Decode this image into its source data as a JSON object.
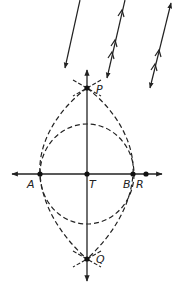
{
  "diagram": {
    "type": "geometric-construction",
    "colors": {
      "stroke": "#222222",
      "background": "#ffffff"
    },
    "points": {
      "P": {
        "label": "P",
        "x": 87,
        "y": 88
      },
      "Q": {
        "label": "Q",
        "x": 87,
        "y": 259
      },
      "A": {
        "label": "A",
        "x": 40,
        "y": 174
      },
      "T": {
        "label": "T",
        "x": 87,
        "y": 174
      },
      "B": {
        "label": "B",
        "x": 133,
        "y": 174
      },
      "R": {
        "label": "R",
        "x": 146,
        "y": 174
      }
    },
    "axes": {
      "horizontal": {
        "x1": 12,
        "x2": 162,
        "y": 174
      },
      "vertical": {
        "x": 87,
        "y1": 70,
        "y2": 281
      }
    },
    "inner_circle": {
      "cx": 87,
      "cy": 174,
      "rx": 47,
      "ry": 50,
      "style": "dashed"
    },
    "outer_arcs": {
      "through": [
        "P",
        "A",
        "Q",
        "B"
      ],
      "style": "dashed"
    },
    "field_lines": [
      {
        "x1": 80,
        "y1": 0,
        "x2": 65,
        "y2": 68,
        "head_top": false,
        "chevrons": []
      },
      {
        "x1": 125,
        "y1": 0,
        "x2": 107,
        "y2": 78,
        "head_top": false,
        "chevrons": [
          0.15,
          0.55,
          0.7
        ]
      },
      {
        "x1": 171,
        "y1": 3,
        "x2": 150,
        "y2": 88,
        "head_top": true,
        "chevrons": [
          0.58,
          0.75
        ]
      }
    ]
  }
}
